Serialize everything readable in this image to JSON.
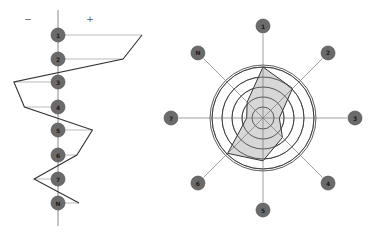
{
  "profile_chart": {
    "minus_label": "−",
    "plus_label": "+",
    "nodes": [
      {
        "label": "1",
        "value": 2.0
      },
      {
        "label": "2",
        "value": 1.55
      },
      {
        "label": "3",
        "value": -1.05
      },
      {
        "label": "4",
        "value": -0.8
      },
      {
        "label": "5",
        "value": 0.82
      },
      {
        "label": "6",
        "value": 0.45
      },
      {
        "label": "7",
        "value": -0.57
      },
      {
        "label": "N",
        "value": 0.5
      }
    ]
  },
  "radar_chart": {
    "axes": [
      {
        "label": "1",
        "angle": 0,
        "value": 5
      },
      {
        "label": "2",
        "angle": 45,
        "value": 4.1
      },
      {
        "label": "3",
        "angle": 90,
        "value": 1.6
      },
      {
        "label": "4",
        "angle": 135,
        "value": 2.7
      },
      {
        "label": "5",
        "angle": 180,
        "value": 4.2
      },
      {
        "label": "6",
        "angle": 225,
        "value": 4.9
      },
      {
        "label": "7",
        "angle": 270,
        "value": 1.6
      },
      {
        "label": "N",
        "angle": 315,
        "value": 2.2
      }
    ],
    "rings": 5,
    "colors": {
      "fill": "#d0d0d0",
      "stroke": "#333333",
      "node": "#6b6b6b"
    }
  },
  "chart_data": {
    "type": "radar",
    "title": "",
    "categories": [
      "1",
      "2",
      "3",
      "4",
      "5",
      "6",
      "7",
      "N"
    ],
    "series": [
      {
        "name": "profile",
        "values": [
          5,
          4.1,
          1.6,
          2.7,
          4.2,
          4.9,
          1.6,
          2.2
        ]
      }
    ],
    "rlim": [
      0,
      5
    ],
    "grid": true
  }
}
